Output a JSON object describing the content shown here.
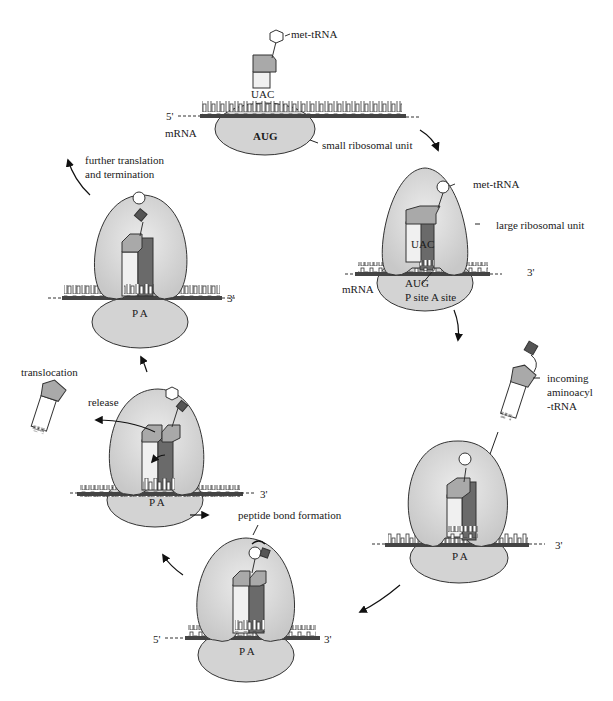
{
  "figure": {
    "colors": {
      "ribosome_fill": "#d4d4d4",
      "ribosome_stroke": "#333333",
      "p_trna_body": "#efefef",
      "p_trna_head": "#a9a9a9",
      "a_trna_body": "#6a6a6a",
      "amino_acid_dark": "#555555",
      "mrna_bar": "#444444",
      "arrow": "#111111"
    }
  },
  "stage1": {
    "met_trna": "met-tRNA",
    "anticodon": "UAC",
    "five_prime": "5'",
    "mrna": "mRNA",
    "codon": "AUG",
    "small_subunit": "small ribosomal unit"
  },
  "stage2": {
    "met_trna": "met-tRNA",
    "large_subunit": "large ribosomal unit",
    "anticodon": "UAC",
    "codon": "AUG",
    "mrna": "mRNA",
    "sites": "P site A site",
    "three_prime": "3'"
  },
  "stage3": {
    "incoming_line1": "incoming",
    "incoming_line2": "aminoacyl",
    "incoming_line3": "-tRNA",
    "sites": "P A",
    "three_prime": "3'"
  },
  "stage4": {
    "peptide_bond": "peptide bond formation",
    "five_prime": "5'",
    "three_prime": "3'",
    "sites": "P A"
  },
  "stage5": {
    "translocation": "translocation",
    "release": "release",
    "sites": "P A",
    "three_prime": "3'"
  },
  "stage6": {
    "further_line1": "further translation",
    "further_line2": "and termination",
    "sites": "P A",
    "three_prime": "3'"
  }
}
